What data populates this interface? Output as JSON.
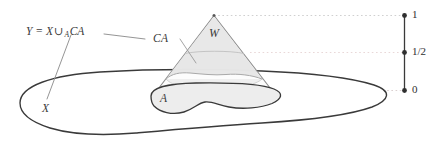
{
  "figure": {
    "caption_labels": {
      "y_space": {
        "prefix": "Y = X",
        "operator": "∪",
        "subscript": "A",
        "suffix": "CA",
        "full_text": "Y = X ∪_A CA"
      },
      "cone": "CA",
      "open_set": "W",
      "subspace": "A",
      "base_space": "X"
    },
    "interval_axis": {
      "ticks": [
        {
          "name": "top",
          "label": "1",
          "value": 1
        },
        {
          "name": "middle",
          "label": "1/2",
          "value": 0.5
        },
        {
          "name": "bottom",
          "label": "0",
          "value": 0
        }
      ],
      "orientation": "vertical"
    },
    "colors": {
      "outline": "#3a3a3a",
      "cone_edge": "#8a8a8a",
      "w_fill": "#e2e2e2",
      "a_fill": "#ededed",
      "cone_fill": "#f2f2f2",
      "guide_top": "#cfcfcf",
      "guide_half": "#e8d6d6",
      "guide_bottom": "#d9cfcf",
      "leader_line": "#8f8f8f",
      "text": "#3a3a3a",
      "background": "#ffffff"
    },
    "guide_lines": [
      {
        "name": "level-1",
        "level": "1"
      },
      {
        "name": "level-half",
        "level": "1/2"
      },
      {
        "name": "level-0",
        "level": "0"
      }
    ]
  }
}
